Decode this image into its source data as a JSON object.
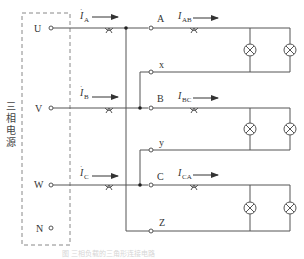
{
  "diagram": {
    "type": "three-phase delta-connected load circuit",
    "source": {
      "label": "三相电源",
      "label_chars": [
        "三",
        "相",
        "电",
        "源"
      ],
      "terminals": [
        "U",
        "V",
        "W",
        "N"
      ]
    },
    "line_currents": [
      {
        "symbol": "I",
        "subscript": "A"
      },
      {
        "symbol": "I",
        "subscript": "B"
      },
      {
        "symbol": "I",
        "subscript": "C"
      }
    ],
    "phase_currents": [
      {
        "symbol": "I",
        "subscript": "AB"
      },
      {
        "symbol": "I",
        "subscript": "BC"
      },
      {
        "symbol": "I",
        "subscript": "CA"
      }
    ],
    "load_terminals": {
      "phase_a": [
        "A",
        "x"
      ],
      "phase_b": [
        "B",
        "y"
      ],
      "phase_c": [
        "C",
        "Z"
      ]
    },
    "loads": [
      {
        "phase": "AB",
        "lamp_count": 2
      },
      {
        "phase": "BC",
        "lamp_count": 2
      },
      {
        "phase": "CA",
        "lamp_count": 2
      }
    ],
    "caption": "图 三相负载的三角形连接电路"
  },
  "colors": {
    "line": "#555555",
    "dashed_box": "#888888",
    "text": "#333333"
  }
}
